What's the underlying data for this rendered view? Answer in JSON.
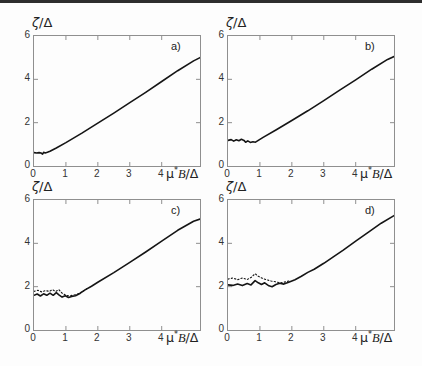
{
  "page": {
    "background": "#fdfdfd",
    "top_rule_color": "#2e2e2e",
    "frame_color": "#8f8f8f",
    "curve_color": "#151515",
    "tick_label_color": "#333333"
  },
  "axis_labels": {
    "ylabel_zeta": "ζ",
    "ylabel_rest": "/Δ",
    "xlabel_mu": "μ",
    "xlabel_sup": "*",
    "xlabel_b": "B",
    "xlabel_rest": "/Δ"
  },
  "chart_data": [
    {
      "type": "line",
      "panel_label": "a)",
      "ylabel": "ζ/Δ",
      "xlabel": "μ*B/Δ",
      "xlim": [
        0,
        5.2
      ],
      "ylim": [
        0,
        6
      ],
      "xticks": [
        "0",
        "1",
        "2",
        "3",
        "4"
      ],
      "yticks": [
        "0",
        "2",
        "4",
        "6"
      ],
      "grid": false,
      "series": [
        {
          "name": "solid",
          "style": "solid",
          "points": [
            [
              0,
              0.62
            ],
            [
              0.08,
              0.6
            ],
            [
              0.16,
              0.62
            ],
            [
              0.22,
              0.6
            ],
            [
              0.27,
              0.55
            ],
            [
              0.3,
              0.63
            ],
            [
              0.35,
              0.6
            ],
            [
              0.42,
              0.63
            ],
            [
              0.5,
              0.68
            ],
            [
              0.7,
              0.83
            ],
            [
              1.0,
              1.08
            ],
            [
              1.5,
              1.52
            ],
            [
              2.0,
              1.98
            ],
            [
              2.5,
              2.44
            ],
            [
              3.0,
              2.92
            ],
            [
              3.5,
              3.4
            ],
            [
              4.0,
              3.9
            ],
            [
              4.5,
              4.4
            ],
            [
              5.0,
              4.85
            ],
            [
              5.2,
              5.0
            ]
          ]
        }
      ]
    },
    {
      "type": "line",
      "panel_label": "b)",
      "ylabel": "ζ/Δ",
      "xlabel": "μ*B/Δ",
      "xlim": [
        0,
        5.2
      ],
      "ylim": [
        0,
        6
      ],
      "xticks": [
        "0",
        "1",
        "2",
        "3",
        "4"
      ],
      "yticks": [
        "0",
        "2",
        "4",
        "6"
      ],
      "grid": false,
      "series": [
        {
          "name": "solid",
          "style": "solid",
          "points": [
            [
              0,
              1.18
            ],
            [
              0.1,
              1.22
            ],
            [
              0.18,
              1.15
            ],
            [
              0.26,
              1.21
            ],
            [
              0.34,
              1.17
            ],
            [
              0.42,
              1.23
            ],
            [
              0.5,
              1.18
            ],
            [
              0.55,
              1.1
            ],
            [
              0.62,
              1.16
            ],
            [
              0.7,
              1.09
            ],
            [
              0.78,
              1.12
            ],
            [
              0.86,
              1.1
            ],
            [
              0.95,
              1.18
            ],
            [
              1.1,
              1.32
            ],
            [
              1.5,
              1.66
            ],
            [
              2.0,
              2.1
            ],
            [
              2.5,
              2.55
            ],
            [
              3.0,
              3.02
            ],
            [
              3.5,
              3.5
            ],
            [
              4.0,
              3.98
            ],
            [
              4.5,
              4.47
            ],
            [
              5.0,
              4.92
            ],
            [
              5.2,
              5.05
            ]
          ]
        }
      ]
    },
    {
      "type": "line",
      "panel_label": "c)",
      "ylabel": "ζ/Δ",
      "xlabel": "μ*B/Δ",
      "xlim": [
        0,
        5.2
      ],
      "ylim": [
        0,
        6
      ],
      "xticks": [
        "0",
        "1",
        "2",
        "3",
        "4"
      ],
      "yticks": [
        "0",
        "2",
        "4",
        "6"
      ],
      "grid": false,
      "series": [
        {
          "name": "solid",
          "style": "solid",
          "points": [
            [
              0,
              1.6
            ],
            [
              0.1,
              1.66
            ],
            [
              0.2,
              1.57
            ],
            [
              0.3,
              1.67
            ],
            [
              0.4,
              1.6
            ],
            [
              0.5,
              1.7
            ],
            [
              0.6,
              1.6
            ],
            [
              0.7,
              1.72
            ],
            [
              0.78,
              1.62
            ],
            [
              0.88,
              1.52
            ],
            [
              0.98,
              1.58
            ],
            [
              1.08,
              1.5
            ],
            [
              1.18,
              1.55
            ],
            [
              1.3,
              1.58
            ],
            [
              1.45,
              1.7
            ],
            [
              1.6,
              1.85
            ],
            [
              1.8,
              2.02
            ],
            [
              2.0,
              2.2
            ],
            [
              2.5,
              2.65
            ],
            [
              3.0,
              3.12
            ],
            [
              3.5,
              3.6
            ],
            [
              4.0,
              4.1
            ],
            [
              4.5,
              4.6
            ],
            [
              5.0,
              5.02
            ],
            [
              5.2,
              5.12
            ]
          ]
        },
        {
          "name": "dotted",
          "style": "dotted",
          "points": [
            [
              0,
              1.78
            ],
            [
              0.12,
              1.83
            ],
            [
              0.24,
              1.76
            ],
            [
              0.36,
              1.82
            ],
            [
              0.48,
              1.78
            ],
            [
              0.58,
              1.86
            ],
            [
              0.68,
              1.78
            ],
            [
              0.78,
              1.86
            ],
            [
              0.88,
              1.7
            ],
            [
              0.98,
              1.62
            ],
            [
              1.08,
              1.58
            ],
            [
              1.2,
              1.6
            ],
            [
              1.35,
              1.65
            ],
            [
              1.5,
              1.76
            ],
            [
              1.65,
              1.9
            ]
          ]
        }
      ]
    },
    {
      "type": "line",
      "panel_label": "d)",
      "ylabel": "ζ/Δ",
      "xlabel": "μ*B/Δ",
      "xlim": [
        0,
        5.2
      ],
      "ylim": [
        0,
        6
      ],
      "xticks": [
        "0",
        "1",
        "2",
        "3",
        "4"
      ],
      "yticks": [
        "0",
        "2",
        "4",
        "6"
      ],
      "grid": false,
      "series": [
        {
          "name": "solid",
          "style": "solid",
          "points": [
            [
              0,
              2.08
            ],
            [
              0.15,
              2.06
            ],
            [
              0.3,
              2.12
            ],
            [
              0.45,
              2.05
            ],
            [
              0.6,
              2.14
            ],
            [
              0.72,
              2.08
            ],
            [
              0.85,
              2.28
            ],
            [
              0.95,
              2.18
            ],
            [
              1.05,
              2.1
            ],
            [
              1.15,
              2.18
            ],
            [
              1.28,
              2.04
            ],
            [
              1.38,
              2.0
            ],
            [
              1.5,
              2.1
            ],
            [
              1.62,
              2.16
            ],
            [
              1.75,
              2.12
            ],
            [
              1.9,
              2.2
            ],
            [
              2.1,
              2.32
            ],
            [
              2.3,
              2.48
            ],
            [
              2.5,
              2.66
            ],
            [
              2.7,
              2.8
            ],
            [
              3.0,
              3.08
            ],
            [
              3.3,
              3.38
            ],
            [
              3.6,
              3.68
            ],
            [
              4.0,
              4.1
            ],
            [
              4.4,
              4.52
            ],
            [
              4.8,
              4.93
            ],
            [
              5.2,
              5.28
            ]
          ]
        },
        {
          "name": "dotted",
          "style": "dotted",
          "points": [
            [
              0,
              2.35
            ],
            [
              0.15,
              2.4
            ],
            [
              0.3,
              2.32
            ],
            [
              0.45,
              2.4
            ],
            [
              0.6,
              2.33
            ],
            [
              0.72,
              2.42
            ],
            [
              0.85,
              2.6
            ],
            [
              0.95,
              2.48
            ],
            [
              1.08,
              2.38
            ],
            [
              1.2,
              2.32
            ],
            [
              1.35,
              2.26
            ],
            [
              1.5,
              2.22
            ],
            [
              1.65,
              2.18
            ],
            [
              1.8,
              2.22
            ],
            [
              1.95,
              2.28
            ]
          ]
        }
      ]
    }
  ]
}
